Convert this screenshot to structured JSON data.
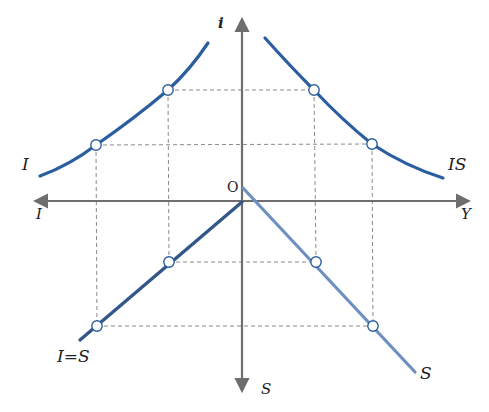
{
  "diagram": {
    "type": "four-quadrant IS curve derivation",
    "colors": {
      "axis": "#6e6e6e",
      "guide": "#8a8a8a",
      "curve_dark": "#2b5e9e",
      "curve_light": "#6d8fc2",
      "curve_i_eq_s": "#34578a",
      "point_fill": "#ffffff",
      "point_stroke": "#2b5e9e",
      "text": "#222222"
    },
    "axes": {
      "up_label": "i",
      "right_label": "Y",
      "left_label": "I",
      "down_label": "S",
      "origin_label": "O"
    },
    "curves": {
      "investment": {
        "label": "I",
        "quadrant": "top-left"
      },
      "is": {
        "label": "IS",
        "quadrant": "top-right"
      },
      "i_equals_s": {
        "label": "I=S",
        "quadrant": "bottom-left"
      },
      "saving": {
        "label": "S",
        "quadrant": "bottom-right"
      }
    },
    "points": {
      "investment": [
        [
          96,
          145
        ],
        [
          168,
          90
        ]
      ],
      "is": [
        [
          314,
          90
        ],
        [
          372,
          144
        ]
      ],
      "i_equals_s": [
        [
          169,
          262
        ],
        [
          97,
          326
        ]
      ],
      "saving": [
        [
          316,
          262
        ],
        [
          373,
          326
        ]
      ]
    }
  }
}
